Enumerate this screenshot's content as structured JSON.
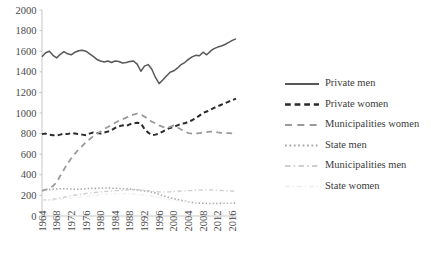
{
  "chart_data": {
    "type": "line",
    "title": "",
    "subtitle": "",
    "xlabel": "",
    "ylabel": "",
    "grid": false,
    "legend_position": "right",
    "xlim": [
      1964,
      2017
    ],
    "ylim": [
      0,
      2000
    ],
    "y_ticks": [
      0,
      200,
      400,
      600,
      800,
      1000,
      1200,
      1400,
      1600,
      1800,
      2000
    ],
    "x_ticks": [
      1964,
      1968,
      1972,
      1976,
      1980,
      1984,
      1988,
      1992,
      1996,
      2000,
      2004,
      2008,
      2012,
      2016
    ],
    "x": [
      1964,
      1965,
      1966,
      1967,
      1968,
      1969,
      1970,
      1971,
      1972,
      1973,
      1974,
      1975,
      1976,
      1977,
      1978,
      1979,
      1980,
      1981,
      1982,
      1983,
      1984,
      1985,
      1986,
      1987,
      1988,
      1989,
      1990,
      1991,
      1992,
      1993,
      1994,
      1995,
      1996,
      1997,
      1998,
      1999,
      2000,
      2001,
      2002,
      2003,
      2004,
      2005,
      2006,
      2007,
      2008,
      2009,
      2010,
      2011,
      2012,
      2013,
      2014,
      2015,
      2016,
      2017
    ],
    "series": [
      {
        "name": "Private men",
        "color": "#585858",
        "style": "solid",
        "width": 1.5,
        "values": [
          1545,
          1585,
          1600,
          1560,
          1535,
          1570,
          1595,
          1575,
          1565,
          1590,
          1605,
          1610,
          1600,
          1575,
          1550,
          1520,
          1505,
          1495,
          1505,
          1490,
          1505,
          1500,
          1485,
          1490,
          1500,
          1505,
          1475,
          1405,
          1455,
          1470,
          1425,
          1345,
          1285,
          1320,
          1360,
          1395,
          1410,
          1435,
          1470,
          1490,
          1520,
          1545,
          1560,
          1555,
          1590,
          1565,
          1600,
          1625,
          1640,
          1650,
          1665,
          1685,
          1705,
          1720
        ]
      },
      {
        "name": "Private women",
        "color": "#2a2a2a",
        "style": "dashed",
        "width": 2.0,
        "values": [
          795,
          800,
          790,
          785,
          780,
          790,
          800,
          795,
          805,
          800,
          795,
          790,
          785,
          800,
          810,
          805,
          800,
          810,
          820,
          835,
          855,
          870,
          880,
          875,
          890,
          900,
          905,
          900,
          845,
          810,
          785,
          790,
          800,
          820,
          840,
          855,
          865,
          880,
          895,
          900,
          915,
          930,
          950,
          975,
          1000,
          1015,
          1030,
          1050,
          1065,
          1080,
          1095,
          1110,
          1125,
          1140
        ]
      },
      {
        "name": "Municipalities women",
        "color": "#9a9a9a",
        "style": "longdash",
        "width": 1.8,
        "values": [
          245,
          255,
          270,
          290,
          330,
          390,
          450,
          510,
          560,
          605,
          645,
          680,
          715,
          745,
          775,
          800,
          820,
          845,
          865,
          885,
          905,
          925,
          940,
          955,
          970,
          985,
          995,
          985,
          965,
          940,
          915,
          900,
          880,
          865,
          855,
          865,
          880,
          860,
          840,
          820,
          805,
          800,
          800,
          805,
          810,
          815,
          820,
          818,
          812,
          808,
          806,
          804,
          802,
          800
        ]
      },
      {
        "name": "State men",
        "color": "#a8a8a8",
        "style": "dotted",
        "width": 1.6,
        "values": [
          250,
          255,
          258,
          260,
          262,
          265,
          265,
          265,
          262,
          260,
          260,
          262,
          265,
          268,
          268,
          268,
          270,
          272,
          272,
          270,
          270,
          268,
          265,
          265,
          262,
          258,
          252,
          248,
          242,
          238,
          232,
          222,
          210,
          198,
          185,
          175,
          168,
          160,
          152,
          145,
          138,
          132,
          128,
          125,
          124,
          123,
          122,
          122,
          122,
          123,
          124,
          124,
          125,
          125
        ]
      },
      {
        "name": "Municipalities men",
        "color": "#cfcfcf",
        "style": "dashdot",
        "width": 1.4,
        "values": [
          150,
          155,
          158,
          162,
          168,
          175,
          182,
          190,
          196,
          202,
          208,
          212,
          218,
          222,
          226,
          230,
          234,
          238,
          240,
          243,
          246,
          248,
          250,
          252,
          254,
          256,
          256,
          254,
          250,
          246,
          242,
          238,
          234,
          232,
          232,
          234,
          238,
          240,
          242,
          244,
          246,
          248,
          250,
          252,
          254,
          254,
          254,
          252,
          250,
          248,
          246,
          244,
          242,
          240
        ]
      },
      {
        "name": "State women",
        "color": "#ededed",
        "style": "dashdot",
        "width": 1.2,
        "values": [
          148,
          150,
          152,
          154,
          158,
          162,
          166,
          170,
          174,
          178,
          182,
          186,
          190,
          194,
          198,
          202,
          206,
          210,
          212,
          214,
          216,
          218,
          218,
          218,
          216,
          214,
          212,
          208,
          204,
          200,
          194,
          188,
          180,
          172,
          164,
          158,
          152,
          148,
          144,
          140,
          138,
          136,
          134,
          133,
          132,
          132,
          132,
          131,
          130,
          130,
          129,
          129,
          128,
          128
        ]
      }
    ],
    "legend": [
      {
        "label": "Private men",
        "color": "#585858",
        "style": "solid"
      },
      {
        "label": "Private women",
        "color": "#2a2a2a",
        "style": "dashed"
      },
      {
        "label": "Municipalities women",
        "color": "#9a9a9a",
        "style": "longdash"
      },
      {
        "label": "State men",
        "color": "#a8a8a8",
        "style": "dotted"
      },
      {
        "label": "Municipalities men",
        "color": "#cfcfcf",
        "style": "dashdot"
      },
      {
        "label": "State women",
        "color": "#ededed",
        "style": "dashdot"
      }
    ]
  }
}
